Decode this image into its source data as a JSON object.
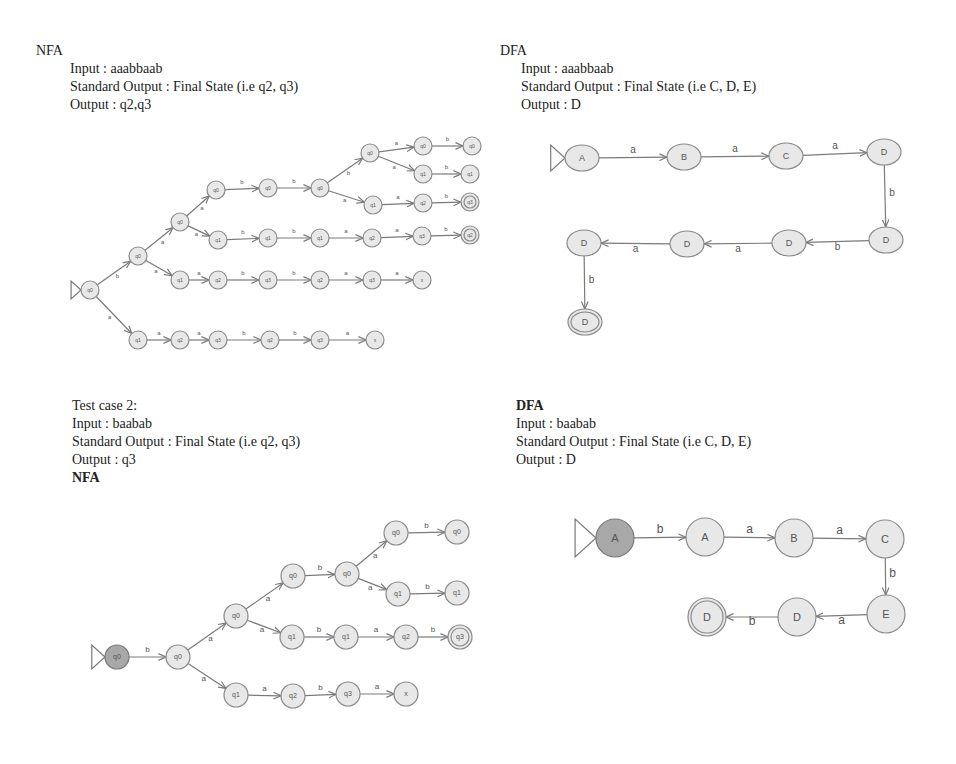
{
  "top_left": {
    "heading": "NFA",
    "input": "Input : aaabbaab",
    "standard_output": "Standard Output : Final State (i.e q2, q3)",
    "output": "Output : q2,q3"
  },
  "top_right": {
    "heading": "DFA",
    "input": "Input : aaabbaab",
    "standard_output": "Standard Output : Final State (i.e C, D, E)",
    "output": "Output : D"
  },
  "bottom_left": {
    "test_case": "Test case 2:",
    "input": "Input : baabab",
    "standard_output": "Standard Output : Final State (i.e q2, q3)",
    "output": "Output : q3",
    "heading": "NFA"
  },
  "bottom_right": {
    "heading": "DFA",
    "input": "Input : baabab",
    "standard_output": "Standard Output : Final State (i.e C, D, E)",
    "output": "Output : D"
  },
  "diagrams": {
    "nfa1": {
      "r": 9,
      "font": 5,
      "nodes": [
        {
          "id": "s",
          "x": 90,
          "y": 290,
          "label": "q0",
          "start": true
        },
        {
          "id": "n1",
          "x": 138,
          "y": 256,
          "label": "q0"
        },
        {
          "id": "n2",
          "x": 180,
          "y": 222,
          "label": "q0"
        },
        {
          "id": "n3",
          "x": 216,
          "y": 190,
          "label": "q0"
        },
        {
          "id": "n4",
          "x": 268,
          "y": 188,
          "label": "q0"
        },
        {
          "id": "n5",
          "x": 320,
          "y": 188,
          "label": "q0"
        },
        {
          "id": "n6",
          "x": 370,
          "y": 153,
          "label": "q0"
        },
        {
          "id": "n7",
          "x": 423,
          "y": 146,
          "label": "q0"
        },
        {
          "id": "n8",
          "x": 472,
          "y": 146,
          "label": "q0"
        },
        {
          "id": "n9",
          "x": 423,
          "y": 174,
          "label": "q1"
        },
        {
          "id": "n10",
          "x": 470,
          "y": 174,
          "label": "q1"
        },
        {
          "id": "n11",
          "x": 373,
          "y": 205,
          "label": "q1"
        },
        {
          "id": "n12",
          "x": 423,
          "y": 203,
          "label": "q2"
        },
        {
          "id": "n13",
          "x": 470,
          "y": 202,
          "label": "q3",
          "final": true
        },
        {
          "id": "n14",
          "x": 218,
          "y": 240,
          "label": "q1"
        },
        {
          "id": "n15",
          "x": 268,
          "y": 238,
          "label": "q1"
        },
        {
          "id": "n16",
          "x": 320,
          "y": 238,
          "label": "q1"
        },
        {
          "id": "n17",
          "x": 372,
          "y": 238,
          "label": "q2"
        },
        {
          "id": "n18",
          "x": 422,
          "y": 236,
          "label": "q3"
        },
        {
          "id": "n19",
          "x": 470,
          "y": 235,
          "label": "q2",
          "final": true
        },
        {
          "id": "n20",
          "x": 180,
          "y": 280,
          "label": "q1"
        },
        {
          "id": "n21",
          "x": 218,
          "y": 280,
          "label": "q2"
        },
        {
          "id": "n22",
          "x": 268,
          "y": 280,
          "label": "q3"
        },
        {
          "id": "n23",
          "x": 320,
          "y": 280,
          "label": "q2"
        },
        {
          "id": "n24",
          "x": 372,
          "y": 280,
          "label": "q3"
        },
        {
          "id": "n25",
          "x": 422,
          "y": 280,
          "label": "x"
        },
        {
          "id": "n26",
          "x": 138,
          "y": 340,
          "label": "q1"
        },
        {
          "id": "n27",
          "x": 180,
          "y": 340,
          "label": "q2"
        },
        {
          "id": "n28",
          "x": 218,
          "y": 340,
          "label": "q3"
        },
        {
          "id": "n29",
          "x": 270,
          "y": 340,
          "label": "q2"
        },
        {
          "id": "n30",
          "x": 320,
          "y": 340,
          "label": "q3"
        },
        {
          "id": "n31",
          "x": 375,
          "y": 340,
          "label": "x"
        }
      ],
      "edges": [
        [
          "s",
          "n1",
          "b"
        ],
        [
          "n1",
          "n2",
          "a"
        ],
        [
          "n2",
          "n3",
          "a"
        ],
        [
          "n3",
          "n4",
          "b"
        ],
        [
          "n4",
          "n5",
          "b"
        ],
        [
          "n5",
          "n6",
          "b"
        ],
        [
          "n6",
          "n7",
          "a"
        ],
        [
          "n7",
          "n8",
          "b"
        ],
        [
          "n6",
          "n9",
          "a"
        ],
        [
          "n9",
          "n10",
          "b"
        ],
        [
          "n5",
          "n11",
          "a"
        ],
        [
          "n11",
          "n12",
          "a"
        ],
        [
          "n12",
          "n13",
          "b"
        ],
        [
          "n2",
          "n14",
          "a"
        ],
        [
          "n14",
          "n15",
          "b"
        ],
        [
          "n15",
          "n16",
          "b"
        ],
        [
          "n16",
          "n17",
          "a"
        ],
        [
          "n17",
          "n18",
          "a"
        ],
        [
          "n18",
          "n19",
          "b"
        ],
        [
          "n1",
          "n20",
          "a"
        ],
        [
          "n20",
          "n21",
          "a"
        ],
        [
          "n21",
          "n22",
          "b"
        ],
        [
          "n22",
          "n23",
          "b"
        ],
        [
          "n23",
          "n24",
          "a"
        ],
        [
          "n24",
          "n25",
          "a"
        ],
        [
          "s",
          "n26",
          "a"
        ],
        [
          "n26",
          "n27",
          "a"
        ],
        [
          "n27",
          "n28",
          "a"
        ],
        [
          "n28",
          "n29",
          "b"
        ],
        [
          "n29",
          "n30",
          "b"
        ],
        [
          "n30",
          "n31",
          "a"
        ]
      ]
    },
    "dfa1": {
      "rx": 17,
      "ry": 13,
      "font": 9,
      "nodes": [
        {
          "id": "A",
          "x": 582,
          "y": 158,
          "label": "A",
          "start": true
        },
        {
          "id": "B",
          "x": 684,
          "y": 157,
          "label": "B"
        },
        {
          "id": "C",
          "x": 786,
          "y": 156,
          "label": "C"
        },
        {
          "id": "D1",
          "x": 884,
          "y": 152,
          "label": "D"
        },
        {
          "id": "D2",
          "x": 886,
          "y": 240,
          "label": "D"
        },
        {
          "id": "D3",
          "x": 789,
          "y": 243,
          "label": "D"
        },
        {
          "id": "D4",
          "x": 687,
          "y": 244,
          "label": "D"
        },
        {
          "id": "D5",
          "x": 584,
          "y": 243,
          "label": "D"
        },
        {
          "id": "D6",
          "x": 585,
          "y": 322,
          "label": "D",
          "final": true
        }
      ],
      "edges": [
        [
          "A",
          "B",
          "a"
        ],
        [
          "B",
          "C",
          "a"
        ],
        [
          "C",
          "D1",
          "a"
        ],
        [
          "D1",
          "D2",
          "b"
        ],
        [
          "D2",
          "D3",
          "b"
        ],
        [
          "D3",
          "D4",
          "a"
        ],
        [
          "D4",
          "D5",
          "a"
        ],
        [
          "D5",
          "D6",
          "b"
        ]
      ]
    },
    "nfa2": {
      "r": 12,
      "font": 7,
      "nodes": [
        {
          "id": "s",
          "x": 117,
          "y": 657,
          "label": "q0",
          "start": true
        },
        {
          "id": "m1",
          "x": 178,
          "y": 657,
          "label": "q0"
        },
        {
          "id": "m2",
          "x": 236,
          "y": 616,
          "label": "q0"
        },
        {
          "id": "m3",
          "x": 293,
          "y": 576,
          "label": "q0"
        },
        {
          "id": "m4",
          "x": 347,
          "y": 574,
          "label": "q0"
        },
        {
          "id": "m5",
          "x": 396,
          "y": 533,
          "label": "q0"
        },
        {
          "id": "m6",
          "x": 457,
          "y": 532,
          "label": "q0"
        },
        {
          "id": "m7",
          "x": 398,
          "y": 594,
          "label": "q1"
        },
        {
          "id": "m8",
          "x": 457,
          "y": 593,
          "label": "q1"
        },
        {
          "id": "m9",
          "x": 292,
          "y": 637,
          "label": "q1"
        },
        {
          "id": "m10",
          "x": 346,
          "y": 637,
          "label": "q1"
        },
        {
          "id": "m11",
          "x": 406,
          "y": 637,
          "label": "q2"
        },
        {
          "id": "m12",
          "x": 460,
          "y": 637,
          "label": "q3",
          "final": true
        },
        {
          "id": "m13",
          "x": 236,
          "y": 695,
          "label": "q1"
        },
        {
          "id": "m14",
          "x": 293,
          "y": 696,
          "label": "q2"
        },
        {
          "id": "m15",
          "x": 348,
          "y": 694,
          "label": "q3"
        },
        {
          "id": "m16",
          "x": 406,
          "y": 694,
          "label": "x"
        }
      ],
      "edges": [
        [
          "s",
          "m1",
          "b"
        ],
        [
          "m1",
          "m2",
          "a"
        ],
        [
          "m2",
          "m3",
          "a"
        ],
        [
          "m3",
          "m4",
          "b"
        ],
        [
          "m4",
          "m5",
          "a"
        ],
        [
          "m5",
          "m6",
          "b"
        ],
        [
          "m4",
          "m7",
          "a"
        ],
        [
          "m7",
          "m8",
          "b"
        ],
        [
          "m2",
          "m9",
          "a"
        ],
        [
          "m9",
          "m10",
          "b"
        ],
        [
          "m10",
          "m11",
          "a"
        ],
        [
          "m11",
          "m12",
          "b"
        ],
        [
          "m1",
          "m13",
          "a"
        ],
        [
          "m13",
          "m14",
          "a"
        ],
        [
          "m14",
          "m15",
          "b"
        ],
        [
          "m15",
          "m16",
          "a"
        ]
      ]
    },
    "dfa2": {
      "r": 19,
      "font": 11,
      "nodes": [
        {
          "id": "A0",
          "x": 615,
          "y": 538,
          "label": "A",
          "start": true
        },
        {
          "id": "A",
          "x": 705,
          "y": 537,
          "label": "A"
        },
        {
          "id": "B",
          "x": 794,
          "y": 538,
          "label": "B"
        },
        {
          "id": "C",
          "x": 885,
          "y": 539,
          "label": "C"
        },
        {
          "id": "E",
          "x": 886,
          "y": 614,
          "label": "E"
        },
        {
          "id": "D",
          "x": 797,
          "y": 617,
          "label": "D"
        },
        {
          "id": "DF",
          "x": 707,
          "y": 617,
          "label": "D",
          "final": true
        }
      ],
      "edges": [
        [
          "A0",
          "A",
          "b"
        ],
        [
          "A",
          "B",
          "a"
        ],
        [
          "B",
          "C",
          "a"
        ],
        [
          "C",
          "E",
          "b"
        ],
        [
          "E",
          "D",
          "a"
        ],
        [
          "D",
          "DF",
          "b"
        ]
      ]
    }
  }
}
